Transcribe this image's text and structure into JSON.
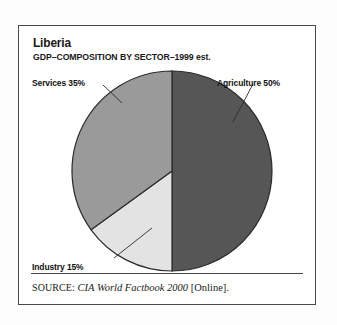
{
  "figure": {
    "title": "Liberia",
    "subtitle": "GDP–COMPOSITION BY SECTOR–1999 est.",
    "source": {
      "keyword": "SOURCE:",
      "title": "CIA World Factbook 2000",
      "suffix": "[Online]."
    },
    "frame_color": "#4a4a4a",
    "background_color": "#ffffff"
  },
  "labels": {
    "services": "Services 35%",
    "agriculture": "Agriculture 50%",
    "industry": "Industry 15%"
  },
  "chart_data": {
    "type": "pie",
    "title": "Liberia",
    "subtitle": "GDP–COMPOSITION BY SECTOR–1999 est.",
    "xlabel": "",
    "ylabel": "",
    "unit": "percent",
    "total": 100,
    "start_angle_deg": 0,
    "direction": "clockwise",
    "legend_position": "callout-labels",
    "grid": false,
    "categories": [
      "Agriculture",
      "Industry",
      "Services"
    ],
    "values": [
      50,
      15,
      35
    ],
    "slices": [
      {
        "name": "Agriculture",
        "value": 50,
        "label": "Agriculture 50%",
        "color": "#565656",
        "start_deg": 0,
        "end_deg": 180
      },
      {
        "name": "Industry",
        "value": 15,
        "label": "Industry 15%",
        "color": "#e3e3e3",
        "start_deg": 180,
        "end_deg": 234
      },
      {
        "name": "Services",
        "value": 35,
        "label": "Services 35%",
        "color": "#9a9a9a",
        "start_deg": 234,
        "end_deg": 360
      }
    ]
  }
}
